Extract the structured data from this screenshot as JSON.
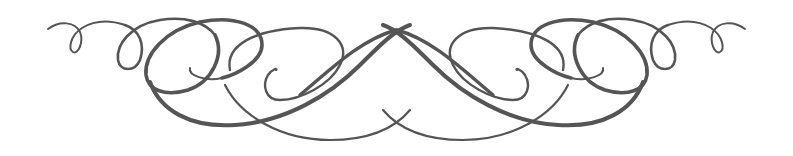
{
  "image": {
    "kind": "decorative-flourish",
    "description": "Symmetric calligraphic scroll ornament with looping swirls",
    "colors": {
      "background": "#ffffff",
      "ink": "#555555"
    }
  }
}
